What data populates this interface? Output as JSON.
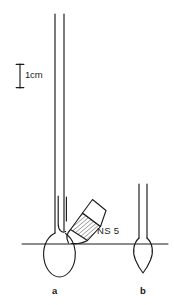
{
  "figure": {
    "kind": "scientific-apparatus-diagram",
    "background_color": "#ffffff",
    "ink_color": "#1a1a1a",
    "width": 174,
    "height": 305
  },
  "scale_bar": {
    "label": "1cm",
    "x": 20,
    "top_y": 64,
    "bottom_y": 88,
    "cap_half_width": 4
  },
  "baseline": {
    "name": "reference-line",
    "y": 244,
    "x_start": 22,
    "x_end": 168
  },
  "items": [
    {
      "id": "a",
      "label": "a",
      "label_x": 52,
      "label_y": 286,
      "description": "long narrow tube with rounded bulb and inner tube, fitted with a tapered ground-glass side joint",
      "tube": {
        "left_x": 55,
        "right_x": 64,
        "top_y": 14,
        "bulb_center_x": 59.5,
        "bulb_top_y": 236,
        "bulb_bottom_y": 276,
        "bulb_half_width": 16
      },
      "inner_tube": {
        "left_x": 58,
        "right_x": 66,
        "top_y": 196,
        "bottom_y": 232
      }
    },
    {
      "id": "b",
      "label": "b",
      "label_x": 140,
      "label_y": 286,
      "description": "short narrow tube with pointed teardrop bulb",
      "tube": {
        "left_x": 139,
        "right_x": 147,
        "top_y": 184,
        "bulb_center_x": 143,
        "bulb_top_y": 240,
        "bulb_bottom_y": 272,
        "bulb_half_width": 8
      }
    }
  ],
  "joint": {
    "name": "ground-glass-joint",
    "label": "NS 5",
    "label_x": 97,
    "label_y": 226,
    "hatched": true,
    "hatch_spacing_px": 2.6,
    "angle_deg": 41,
    "narrow_end": {
      "x": 72,
      "y": 228
    },
    "wide_end": {
      "x": 100,
      "y": 200
    }
  },
  "annotations": {
    "scale_text": "1cm",
    "joint_text": "NS 5",
    "item_a_text": "a",
    "item_b_text": "b"
  }
}
